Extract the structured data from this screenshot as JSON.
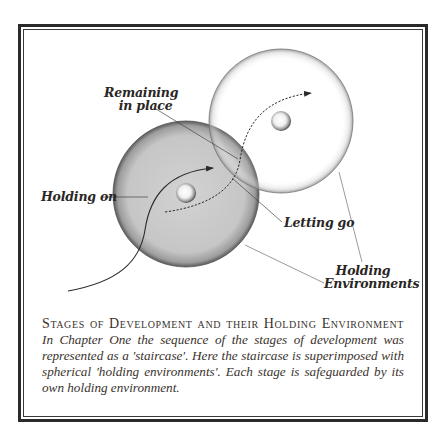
{
  "figure": {
    "labels": {
      "remaining_line1": "Remaining",
      "remaining_line2": "in place",
      "holding_on": "Holding on",
      "letting_go": "Letting go",
      "holding_env_line1": "Holding",
      "holding_env_line2": "Environments"
    },
    "colors": {
      "frame": "#2a2a2a",
      "dark_sphere": "#c9c9c9",
      "light_sphere": "#ffffff",
      "text": "#2a2624"
    },
    "spheres": [
      {
        "name": "lower-stage-environment",
        "cx": 186,
        "cy": 194,
        "r": 73,
        "shade": "gray"
      },
      {
        "name": "upper-stage-environment",
        "cx": 281,
        "cy": 121,
        "r": 72,
        "shade": "white"
      }
    ]
  },
  "caption": {
    "title": "Stages of Development and their Holding Environment",
    "body": "In Chapter One the sequence of the stages of development was represented as a 'staircase'. Here the staircase is superimposed with spherical 'holding environments'. Each stage is safeguarded by its own holding environment."
  }
}
